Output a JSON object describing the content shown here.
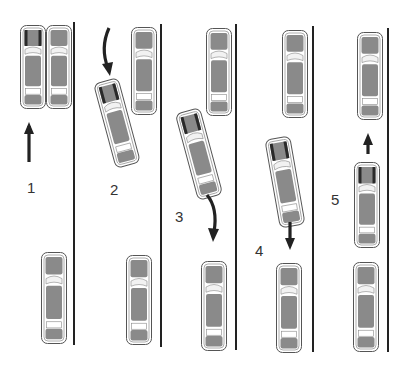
{
  "diagram": {
    "type": "parallel-parking-steps",
    "colors": {
      "car_body": "#8a8a8a",
      "car_outline": "#555555",
      "car_glass": "#f2f2f2",
      "line": "#222222",
      "arrow": "#222222",
      "highlight": "#2a2a2a"
    },
    "steps": [
      {
        "label": "1",
        "label_x": 27,
        "label_y": 188
      },
      {
        "label": "2",
        "label_x": 110,
        "label_y": 190
      },
      {
        "label": "3",
        "label_x": 175,
        "label_y": 217
      },
      {
        "label": "4",
        "label_x": 255,
        "label_y": 251
      },
      {
        "label": "5",
        "label_x": 331,
        "label_y": 200
      }
    ],
    "curb_lines": [
      {
        "x": 74,
        "y1": 22,
        "y2": 345
      },
      {
        "x": 161,
        "y1": 24,
        "y2": 347
      },
      {
        "x": 236,
        "y1": 24,
        "y2": 350
      },
      {
        "x": 313,
        "y1": 26,
        "y2": 352
      },
      {
        "x": 388,
        "y1": 28,
        "y2": 352
      }
    ],
    "cars": [
      {
        "id": "s1-own",
        "x": 33,
        "y": 67,
        "w": 22,
        "h": 80,
        "angle": 0,
        "highlight": true
      },
      {
        "id": "s1-front",
        "x": 59,
        "y": 67,
        "w": 22,
        "h": 80,
        "angle": 0,
        "highlight": false
      },
      {
        "id": "s1-rear",
        "x": 54,
        "y": 298,
        "w": 22,
        "h": 88,
        "angle": 0,
        "highlight": false
      },
      {
        "id": "s2-own",
        "x": 117,
        "y": 123,
        "w": 22,
        "h": 84,
        "angle": -15,
        "highlight": true
      },
      {
        "id": "s2-front",
        "x": 144,
        "y": 71,
        "w": 22,
        "h": 84,
        "angle": 0,
        "highlight": false
      },
      {
        "id": "s2-rear",
        "x": 139,
        "y": 300,
        "w": 22,
        "h": 86,
        "angle": 0,
        "highlight": false
      },
      {
        "id": "s3-own",
        "x": 199,
        "y": 154,
        "w": 22,
        "h": 86,
        "angle": -15,
        "highlight": true
      },
      {
        "id": "s3-front",
        "x": 219,
        "y": 72,
        "w": 22,
        "h": 84,
        "angle": 0,
        "highlight": false
      },
      {
        "id": "s3-rear",
        "x": 214,
        "y": 306,
        "w": 22,
        "h": 86,
        "angle": 0,
        "highlight": false
      },
      {
        "id": "s4-own",
        "x": 285,
        "y": 182,
        "w": 22,
        "h": 86,
        "angle": -10,
        "highlight": true
      },
      {
        "id": "s4-front",
        "x": 295,
        "y": 74,
        "w": 22,
        "h": 84,
        "angle": 0,
        "highlight": false
      },
      {
        "id": "s4-rear",
        "x": 289,
        "y": 308,
        "w": 22,
        "h": 86,
        "angle": 0,
        "highlight": false
      },
      {
        "id": "s5-own",
        "x": 367,
        "y": 205,
        "w": 22,
        "h": 82,
        "angle": 0,
        "highlight": true
      },
      {
        "id": "s5-front",
        "x": 370,
        "y": 76,
        "w": 22,
        "h": 84,
        "angle": 0,
        "highlight": false
      },
      {
        "id": "s5-rear",
        "x": 366,
        "y": 307,
        "w": 22,
        "h": 86,
        "angle": 0,
        "highlight": false
      }
    ],
    "arrows": [
      {
        "id": "a1",
        "direction": "up",
        "path": "M29,162 L29,126",
        "head": "29,122 24,134 34,134"
      },
      {
        "id": "a2",
        "direction": "curve-down",
        "path": "M109,28 Q100,48 108,68",
        "head": "110,76 102,64 113,62"
      },
      {
        "id": "a3",
        "direction": "curve-down",
        "path": "M207,195 Q218,208 214,232",
        "head": "213,242 208,228 219,229"
      },
      {
        "id": "a4",
        "direction": "down",
        "path": "M290,222 L290,240",
        "head": "290,250 285,238 295,238"
      },
      {
        "id": "a5",
        "direction": "up",
        "path": "M368,154 L368,140",
        "head": "368,133 363,145 373,145"
      }
    ]
  }
}
